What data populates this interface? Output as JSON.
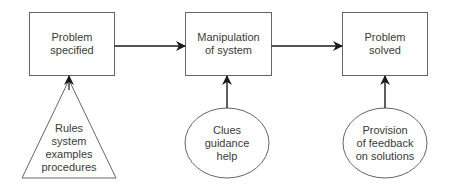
{
  "diagram": {
    "boxes": [
      {
        "id": "problem-specified",
        "lines": [
          "Problem",
          "specified"
        ]
      },
      {
        "id": "manipulation-of-system",
        "lines": [
          "Manipulation",
          "of system"
        ]
      },
      {
        "id": "problem-solved",
        "lines": [
          "Problem",
          "solved"
        ]
      }
    ],
    "inputs": [
      {
        "id": "rules",
        "shape": "triangle",
        "lines": [
          "Rules",
          "system",
          "examples",
          "procedures"
        ]
      },
      {
        "id": "clues",
        "shape": "ellipse",
        "lines": [
          "Clues",
          "guidance",
          "help"
        ]
      },
      {
        "id": "feedback",
        "shape": "ellipse",
        "lines": [
          "Provision",
          "of feedback",
          "on solutions"
        ]
      }
    ],
    "edges": [
      {
        "from": "problem-specified",
        "to": "manipulation-of-system"
      },
      {
        "from": "manipulation-of-system",
        "to": "problem-solved"
      },
      {
        "from": "rules",
        "to": "problem-specified"
      },
      {
        "from": "clues",
        "to": "manipulation-of-system"
      },
      {
        "from": "feedback",
        "to": "problem-solved"
      }
    ],
    "colors": {
      "stroke": "#555555",
      "arrow": "#1a1a1a",
      "text": "#3a3a3a"
    }
  }
}
